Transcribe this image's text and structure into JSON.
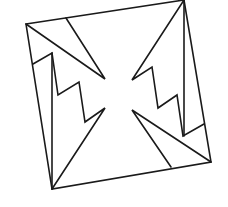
{
  "figure": {
    "stroke_color": "#1a1a1a",
    "background": "#ffffff",
    "square": [
      [
        26,
        24
      ],
      [
        184,
        0
      ],
      [
        211,
        162
      ],
      [
        52,
        189
      ]
    ],
    "top_left_triangle": [
      [
        26,
        24
      ],
      [
        105,
        79
      ],
      [
        66,
        18
      ]
    ],
    "bottom_right_triangle": [
      [
        211,
        162
      ],
      [
        132,
        110
      ],
      [
        171,
        167
      ]
    ],
    "left_zigzag": [
      [
        33,
        64
      ],
      [
        52,
        53
      ],
      [
        58,
        95
      ],
      [
        79,
        82
      ],
      [
        85,
        122
      ],
      [
        105,
        108
      ],
      [
        52,
        189
      ]
    ],
    "left_vertical": [
      [
        52,
        53
      ],
      [
        52,
        189
      ]
    ],
    "right_zigzag": [
      [
        184,
        0
      ],
      [
        132,
        80
      ],
      [
        152,
        67
      ],
      [
        158,
        108
      ],
      [
        177,
        95
      ],
      [
        183,
        136
      ],
      [
        204,
        124
      ]
    ],
    "right_vertical": [
      [
        184,
        0
      ],
      [
        184,
        136
      ]
    ]
  }
}
